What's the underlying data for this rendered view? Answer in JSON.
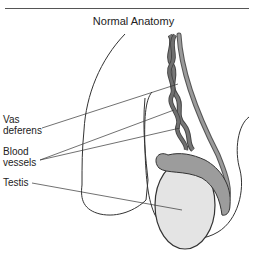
{
  "title": "Normal Anatomy",
  "labels": {
    "vas_deferens": [
      "Vas",
      "deferens"
    ],
    "blood_vessels": [
      "Blood",
      "vessels"
    ],
    "testis": "Testis"
  },
  "colors": {
    "cord": "#6f6f6f",
    "cord_light": "#9a9a9a",
    "epididymis": "#9c9c9c",
    "testis_fill": "#e4e4e4",
    "outline": "#333333"
  }
}
